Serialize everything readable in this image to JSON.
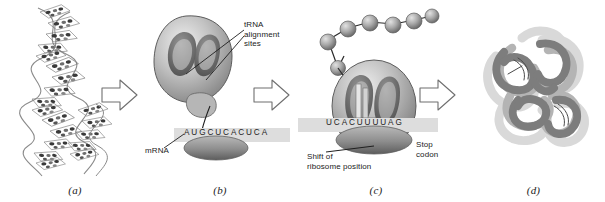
{
  "figure": {
    "background_color": "#ffffff"
  },
  "panels": [
    {
      "id": "a",
      "label": "(a)",
      "name": "dna-double-helix",
      "description": "DNA double helix with base pairs"
    },
    {
      "id": "b",
      "label": "(b)",
      "name": "ribosome-mrna-binding",
      "description": "Ribosome with tRNA alignment sites above mRNA strand",
      "callouts": [
        {
          "name": "trna-alignment-sites-label",
          "text": "tRNA\nalignment\nsites"
        },
        {
          "name": "mrna-label",
          "text": "mRNA"
        }
      ],
      "sequence": "AUGCUCACUCA"
    },
    {
      "id": "c",
      "label": "(c)",
      "name": "translation-elongation",
      "description": "Ribosome translating mRNA with growing polypeptide chain",
      "callouts": [
        {
          "name": "shift-of-ribosome-position-label",
          "text": "Shift of\nribosome position"
        },
        {
          "name": "stop-codon-label",
          "text": "Stop\ncodon"
        }
      ],
      "sequence": "UCACUUUUAG",
      "anticodon": "AAA",
      "polypeptide_bead_count": 9
    },
    {
      "id": "d",
      "label": "(d)",
      "name": "folded-protein",
      "description": "Folded tertiary protein structure"
    }
  ],
  "arrows": [
    {
      "name": "arrow-a-to-b",
      "direction": "right"
    },
    {
      "name": "arrow-b-to-c",
      "direction": "right"
    },
    {
      "name": "arrow-c-to-d",
      "direction": "right"
    }
  ],
  "colors": {
    "ink": "#1c1c1c",
    "outline": "#5a5a5a",
    "ribosome_dark": "#6e6e6e",
    "ribosome_mid": "#9a9a9a",
    "ribosome_light": "#cfcfcf",
    "mrna_band": "#dcdcdc",
    "protein_dark": "#7c7c7c",
    "protein_light": "#c4c4c4"
  }
}
